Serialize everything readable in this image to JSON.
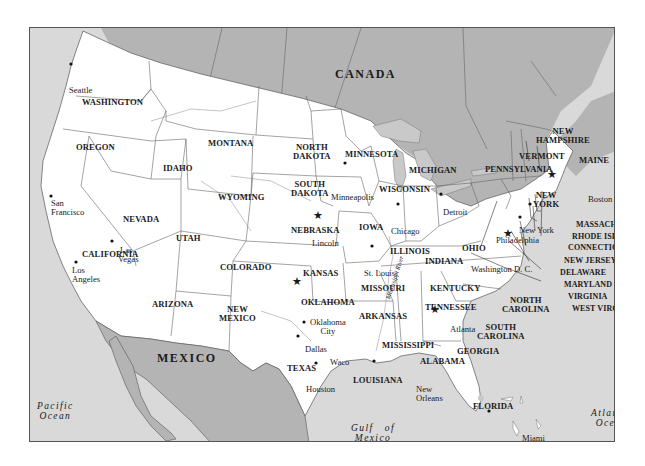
{
  "map": {
    "colors": {
      "usa_land": "#ffffff",
      "foreign_land": "#b4b4b4",
      "water": "#d9d9d9",
      "great_lakes": "#c9c9c9",
      "border": "#555555",
      "text": "#1a1a1a"
    },
    "countries": {
      "canada": "CANADA",
      "mexico": "MEXICO"
    },
    "water_bodies": {
      "pacific": [
        "Pacific",
        "Ocean"
      ],
      "atlantic": [
        "Atlantic",
        "Ocean"
      ],
      "gulf": [
        "Gulf   of",
        "Mexico"
      ]
    },
    "rivers": {
      "mississippi": "Mississippi River"
    },
    "states": {
      "washington": "WASHINGTON",
      "oregon": "OREGON",
      "idaho": "IDAHO",
      "montana": "MONTANA",
      "wyoming": "WYOMING",
      "north_dakota": [
        "NORTH",
        "DAKOTA"
      ],
      "south_dakota": [
        "SOUTH",
        "DAKOTA"
      ],
      "minnesota": "MINNESOTA",
      "wisconsin": "WISCONSIN",
      "michigan": "MICHIGAN",
      "nevada": "NEVADA",
      "california": "CALIFORNIA",
      "utah": "UTAH",
      "colorado": "COLORADO",
      "nebraska": "NEBRASKA",
      "iowa": "IOWA",
      "illinois": "ILLINOIS",
      "indiana": "INDIANA",
      "ohio": "OHIO",
      "pennsylvania": "PENNSYLVANIA",
      "new_york": [
        "NEW",
        "YORK"
      ],
      "kansas": "KANSAS",
      "missouri": "MISSOURI",
      "kentucky": "KENTUCKY",
      "arizona": "ARIZONA",
      "new_mexico": [
        "NEW",
        "MEXICO"
      ],
      "oklahoma": "OKLAHOMA",
      "arkansas": "ARKANSAS",
      "tennessee": "TENNESSEE",
      "north_carolina": [
        "NORTH",
        "CAROLINA"
      ],
      "south_carolina": [
        "SOUTH",
        "CAROLINA"
      ],
      "mississippi": "MISSISSIPPI",
      "alabama": "ALABAMA",
      "georgia": "GEORGIA",
      "texas": "TEXAS",
      "louisiana": "LOUISIANA",
      "florida": "FLORIDA",
      "maine": "MAINE",
      "new_hampshire": [
        "NEW",
        "HAMPSHIRE"
      ],
      "vermont": "VERMONT",
      "massachusetts": "MASSACHUSETTS",
      "rhode_island": "RHODE ISLAND",
      "connecticut": "CONNECTICUT",
      "new_jersey": "NEW JERSEY",
      "delaware": "DELAWARE",
      "maryland": "MARYLAND",
      "virginia": "VIRGINIA",
      "west_virginia": "WEST VIRGINIA"
    },
    "cities": {
      "seattle": "Seattle",
      "san_francisco": [
        "San",
        "Francisco"
      ],
      "las_vegas": [
        "Las",
        "Vegas"
      ],
      "los_angeles": [
        "Los",
        "Angeles"
      ],
      "minneapolis": "Minneapolis",
      "lincoln": "Lincoln",
      "chicago": "Chicago",
      "detroit": "Detroit",
      "st_louis": "St. Louis",
      "oklahoma_city": [
        "Oklahoma",
        "City"
      ],
      "dallas": "Dallas",
      "waco": "Waco",
      "houston": "Houston",
      "new_orleans": [
        "New",
        "Orleans"
      ],
      "atlanta": "Atlanta",
      "miami": "Miami",
      "washington_dc": "Washington D. C.",
      "philadelphia": "Philadelphia",
      "new_york": "New York",
      "boston": "Boston"
    },
    "markers": {
      "star_cities": [
        "Lincoln",
        "Oklahoma City",
        "Atlanta",
        "Washington D. C.",
        "Boston"
      ],
      "dot_cities": [
        "Seattle",
        "San Francisco",
        "Las Vegas",
        "Los Angeles",
        "Minneapolis",
        "Chicago",
        "Detroit",
        "St. Louis",
        "Dallas",
        "Waco",
        "Houston",
        "New Orleans",
        "Miami",
        "Philadelphia",
        "New York"
      ]
    }
  }
}
